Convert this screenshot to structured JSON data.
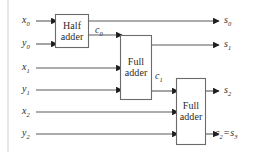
{
  "figure": {
    "line_color": "#5a5a5a",
    "box_border_color": "#6b6b6b",
    "text_color": "#2b2b2b",
    "background": "#ffffff",
    "width": 265,
    "height": 152
  },
  "blocks": [
    {
      "id": "half-adder",
      "line1": "Half",
      "line2": "adder",
      "x": 55,
      "y": 14,
      "w": 34,
      "h": 34
    },
    {
      "id": "full-adder-1",
      "line1": "Full",
      "line2": "adder",
      "x": 120,
      "y": 35,
      "w": 32,
      "h": 65
    },
    {
      "id": "full-adder-2",
      "line1": "Full",
      "line2": "adder",
      "x": 176,
      "y": 78,
      "w": 30,
      "h": 67
    }
  ],
  "inputs": [
    {
      "id": "x0",
      "base": "x",
      "sub": "0",
      "x": 22,
      "y": 21
    },
    {
      "id": "y0",
      "base": "y",
      "sub": "0",
      "x": 22,
      "y": 44
    },
    {
      "id": "x1",
      "base": "x",
      "sub": "1",
      "x": 22,
      "y": 68
    },
    {
      "id": "y1",
      "base": "y",
      "sub": "1",
      "x": 22,
      "y": 90
    },
    {
      "id": "x2",
      "base": "x",
      "sub": "2",
      "x": 22,
      "y": 112
    },
    {
      "id": "y2",
      "base": "y",
      "sub": "2",
      "x": 22,
      "y": 134
    }
  ],
  "outputs": [
    {
      "id": "s0",
      "base": "s",
      "sub": "0",
      "x": 224,
      "y": 21
    },
    {
      "id": "s1",
      "base": "s",
      "sub": "1",
      "x": 224,
      "y": 45
    },
    {
      "id": "s2",
      "base": "s",
      "sub": "2",
      "x": 224,
      "y": 91
    },
    {
      "id": "c2s3",
      "base": "c",
      "sub": "2",
      "eq": "=",
      "base2": "s",
      "sub2": "3",
      "x": 215,
      "y": 134
    }
  ],
  "internal_signals": [
    {
      "id": "c0",
      "base": "c",
      "sub": "0",
      "x": 95,
      "y": 25
    },
    {
      "id": "c1",
      "base": "c",
      "sub": "1",
      "x": 155,
      "y": 71
    }
  ]
}
